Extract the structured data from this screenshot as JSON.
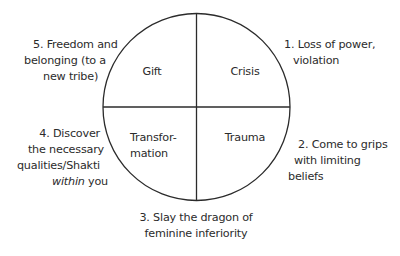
{
  "diagram": {
    "type": "quadrant-circle",
    "stroke_color": "#2b2b2b",
    "text_color": "#2b2b2b",
    "quadrants": {
      "top_left": "Gift",
      "top_right": "Crisis",
      "bottom_left": [
        "Transfor-",
        "mation"
      ],
      "bottom_right": "Trauma"
    },
    "stages": [
      {
        "id": 1,
        "lines": [
          "1. Loss of power,",
          "violation"
        ]
      },
      {
        "id": 2,
        "lines": [
          "2. Come to grips",
          "with limiting",
          "beliefs"
        ]
      },
      {
        "id": 3,
        "lines": [
          "3. Slay the dragon of",
          "feminine inferiority"
        ]
      },
      {
        "id": 4,
        "lines": [
          "4. Discover",
          "the necessary",
          "qualities/Shakti"
        ],
        "last_line": {
          "italic": "within",
          "rest": " you"
        }
      },
      {
        "id": 5,
        "lines": [
          "5. Freedom and",
          "belonging (to a",
          "new tribe)"
        ]
      }
    ]
  }
}
